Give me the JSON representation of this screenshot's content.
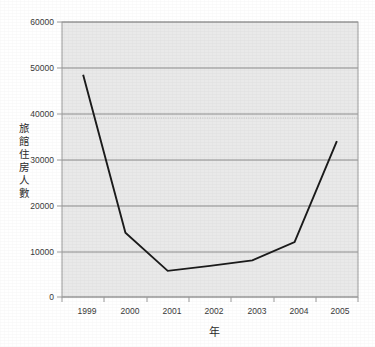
{
  "chart_data": {
    "type": "line",
    "title": "",
    "xlabel": "年",
    "ylabel": "旅館住房人數",
    "ylabel_chars": [
      "旅",
      "館",
      "住",
      "房",
      "人",
      "數"
    ],
    "categories": [
      "1999",
      "2000",
      "2001",
      "2002",
      "2003",
      "2004",
      "2005"
    ],
    "values": [
      48500,
      14000,
      5700,
      6800,
      8000,
      12000,
      34000
    ],
    "series": [
      {
        "name": "旅館住房人數",
        "values": [
          48500,
          14000,
          5700,
          6800,
          8000,
          12000,
          34000
        ]
      }
    ],
    "ylim": [
      0,
      60000
    ],
    "y_ticks": [
      "0",
      "10000",
      "20000",
      "30000",
      "40000",
      "50000",
      "60000"
    ],
    "y_tick_values": [
      0,
      10000,
      20000,
      30000,
      40000,
      50000,
      60000
    ],
    "x_ticks": [
      "1999",
      "2000",
      "2001",
      "2002",
      "2003",
      "2004",
      "2005"
    ],
    "grid": true,
    "grid_axis": "y",
    "legend": false,
    "legend_position": "none",
    "line_color": "#1b1b1b",
    "plot_background": "#e9e9e9",
    "grid_color": "#8c8c8c",
    "axis_color": "#9a9a9a"
  }
}
